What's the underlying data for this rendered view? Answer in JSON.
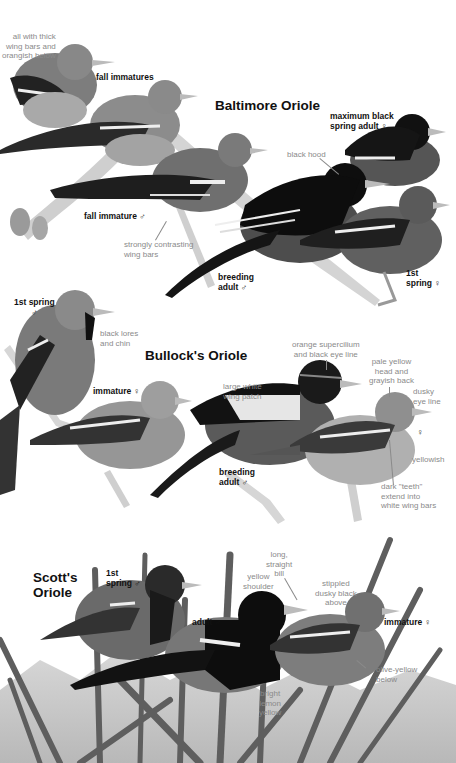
{
  "plate": {
    "sections": [
      {
        "species": "Baltimore Oriole",
        "labels": {
          "fall_immatures": "fall immatures",
          "max_black": "maximum black\nspring adult ♀",
          "fall_imm_male": "fall immature ♂",
          "breeding_adult_male": "breeding\nadult ♂",
          "first_spring_female": "1st\nspring ♀"
        },
        "notes": {
          "thick_wing_bars": "all with thick\nwing bars and\norangish below",
          "black_hood": "black hood",
          "contrasting_wing_bars": "strongly contrasting\nwing bars"
        }
      },
      {
        "species": "Bullock's Oriole",
        "labels": {
          "first_spring_male": "1st spring\n♂",
          "immature_female": "immature ♀",
          "breeding_adult_male": "breeding\nadult ♂",
          "female": "♀"
        },
        "notes": {
          "black_lores": "black lores\nand chin",
          "supercilium": "orange supercilium\nand black eye line",
          "wing_patch": "large white\nwing patch",
          "pale_yellow_head": "pale yellow\nhead and\ngrayish back",
          "dusky_eye_line": "dusky\neye line",
          "yellowish": "yellowish",
          "dark_teeth": "dark \"teeth\"\nextend into\nwhite wing bars"
        }
      },
      {
        "species": "Scott's\nOriole",
        "labels": {
          "first_spring_male": "1st\nspring ♂",
          "adult_male": "adult ♂",
          "immature_female": "immature ♀"
        },
        "notes": {
          "yellow_shoulder": "yellow\nshoulder",
          "long_bill": "long,\nstraight\nbill",
          "stippled": "stippled\ndusky black\nabove",
          "olive_yellow": "olive-yellow\nbelow",
          "bright_lemon": "bright\nlemon\nyellow"
        }
      }
    ],
    "colors": {
      "background": "#ffffff",
      "label": "#111111",
      "note": "#8a8a8a"
    }
  }
}
